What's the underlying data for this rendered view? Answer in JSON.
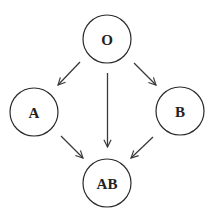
{
  "diagram": {
    "type": "directed-graph",
    "nodes": [
      {
        "id": "O",
        "label": "O",
        "cx": 107,
        "cy": 39,
        "r": 24
      },
      {
        "id": "A",
        "label": "A",
        "cx": 34,
        "cy": 112,
        "r": 24
      },
      {
        "id": "B",
        "label": "B",
        "cx": 180,
        "cy": 111,
        "r": 24
      },
      {
        "id": "AB",
        "label": "AB",
        "cx": 107,
        "cy": 183,
        "r": 24
      }
    ],
    "edges": [
      {
        "from": "O",
        "to": "A",
        "x1": 80,
        "y1": 62,
        "x2": 58,
        "y2": 85
      },
      {
        "from": "O",
        "to": "AB",
        "x1": 107.5,
        "y1": 73,
        "x2": 107.5,
        "y2": 147
      },
      {
        "from": "O",
        "to": "B",
        "x1": 134,
        "y1": 63,
        "x2": 156,
        "y2": 85
      },
      {
        "from": "A",
        "to": "AB",
        "x1": 61,
        "y1": 136,
        "x2": 83,
        "y2": 158
      },
      {
        "from": "B",
        "to": "AB",
        "x1": 153,
        "y1": 137,
        "x2": 131,
        "y2": 158
      }
    ],
    "colors": {
      "stroke": "#2a2a2a",
      "edge": "#3a3a3a",
      "label": "#222222",
      "background": "#ffffff"
    }
  }
}
